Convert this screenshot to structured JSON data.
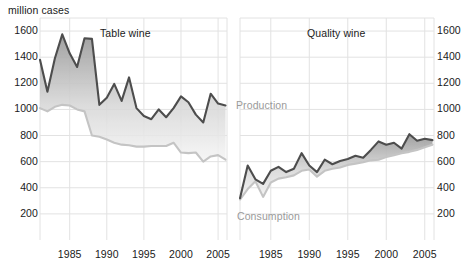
{
  "axis_unit_label": "million cases",
  "panels": [
    {
      "id": "table-wine",
      "title": "Table wine"
    },
    {
      "id": "quality-wine",
      "title": "Quality wine"
    }
  ],
  "series_labels": {
    "production": "Production",
    "consumption": "Consumption"
  },
  "y_ticks_left": [
    "1600",
    "1400",
    "1200",
    "1000",
    "800",
    "600",
    "400",
    "200"
  ],
  "y_ticks_right": [
    "1600",
    "1400",
    "1200",
    "1000",
    "800",
    "600",
    "400",
    "200"
  ],
  "x_ticks_left": [
    "1985",
    "1990",
    "1995",
    "2000",
    "2005"
  ],
  "x_ticks_right": [
    "1985",
    "1990",
    "1995",
    "2000",
    "2005"
  ],
  "colors": {
    "production_line": "#4d4d4d",
    "consumption_line": "#c4c4c4",
    "grid": "#e2e2e2",
    "text": "#1a1a1a",
    "label_grey": "#9a9a9a",
    "fill_top": "#8c8c8c",
    "fill_bottom": "#f4f4f4"
  },
  "chart_data": [
    {
      "type": "area",
      "id": "table-wine",
      "title": "Table wine",
      "xlabel": "",
      "ylabel": "million cases",
      "ylim": [
        0,
        1700
      ],
      "xlim": [
        1981,
        2006
      ],
      "grid": true,
      "legend_position": "inline-right",
      "x": [
        1981,
        1982,
        1983,
        1984,
        1985,
        1986,
        1987,
        1988,
        1989,
        1990,
        1991,
        1992,
        1993,
        1994,
        1995,
        1996,
        1997,
        1998,
        1999,
        2000,
        2001,
        2002,
        2003,
        2004,
        2005,
        2006
      ],
      "series": [
        {
          "name": "Production",
          "values": [
            1380,
            1135,
            1390,
            1575,
            1430,
            1325,
            1545,
            1540,
            1035,
            1090,
            1195,
            1065,
            1245,
            1010,
            950,
            925,
            1000,
            940,
            1010,
            1100,
            1055,
            960,
            900,
            1120,
            1045,
            1030
          ]
        },
        {
          "name": "Consumption",
          "values": [
            1010,
            985,
            1020,
            1035,
            1030,
            1000,
            985,
            800,
            790,
            770,
            745,
            730,
            725,
            715,
            715,
            720,
            720,
            720,
            745,
            670,
            665,
            670,
            600,
            640,
            650,
            615,
            660
          ]
        }
      ]
    },
    {
      "type": "area",
      "id": "quality-wine",
      "title": "Quality wine",
      "xlabel": "",
      "ylabel": "million cases",
      "ylim": [
        0,
        1700
      ],
      "xlim": [
        1981,
        2006
      ],
      "grid": true,
      "legend_position": "inline",
      "x": [
        1981,
        1982,
        1983,
        1984,
        1985,
        1986,
        1987,
        1988,
        1989,
        1990,
        1991,
        1992,
        1993,
        1994,
        1995,
        1996,
        1997,
        1998,
        1999,
        2000,
        2001,
        2002,
        2003,
        2004,
        2005,
        2006
      ],
      "series": [
        {
          "name": "Production",
          "values": [
            320,
            570,
            465,
            430,
            530,
            560,
            520,
            545,
            665,
            570,
            520,
            615,
            580,
            605,
            620,
            645,
            630,
            690,
            755,
            730,
            745,
            700,
            810,
            760,
            775,
            765
          ]
        },
        {
          "name": "Consumption",
          "values": [
            310,
            390,
            450,
            330,
            440,
            470,
            480,
            495,
            530,
            540,
            485,
            530,
            545,
            555,
            575,
            585,
            595,
            610,
            615,
            635,
            650,
            665,
            675,
            690,
            710,
            730
          ]
        }
      ]
    }
  ]
}
